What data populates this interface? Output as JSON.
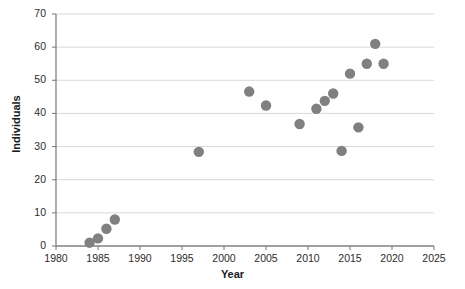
{
  "chart_data": {
    "type": "scatter",
    "title": "",
    "xlabel": "Year",
    "ylabel": "Individuals",
    "xlim": [
      1980,
      2025
    ],
    "ylim": [
      0,
      70
    ],
    "xticks": [
      1980,
      1985,
      1990,
      1995,
      2000,
      2005,
      2010,
      2015,
      2020,
      2025
    ],
    "yticks": [
      0,
      10,
      20,
      30,
      40,
      50,
      60,
      70
    ],
    "grid": "horizontal",
    "legend": null,
    "marker": {
      "shape": "circle",
      "color": "#808080",
      "size": 5.2
    },
    "series": [
      {
        "name": "Individuals",
        "points": [
          {
            "x": 1984,
            "y": 1.0
          },
          {
            "x": 1985,
            "y": 2.3
          },
          {
            "x": 1986,
            "y": 5.2
          },
          {
            "x": 1987,
            "y": 8.0
          },
          {
            "x": 1997,
            "y": 28.4
          },
          {
            "x": 2003,
            "y": 46.6
          },
          {
            "x": 2005,
            "y": 42.4
          },
          {
            "x": 2009,
            "y": 36.8
          },
          {
            "x": 2011,
            "y": 41.4
          },
          {
            "x": 2012,
            "y": 43.8
          },
          {
            "x": 2013,
            "y": 46.0
          },
          {
            "x": 2014,
            "y": 28.7
          },
          {
            "x": 2015,
            "y": 52.0
          },
          {
            "x": 2016,
            "y": 35.8
          },
          {
            "x": 2017,
            "y": 55.0
          },
          {
            "x": 2018,
            "y": 61.0
          },
          {
            "x": 2019,
            "y": 55.0
          }
        ]
      }
    ]
  },
  "style": {
    "axis_color": "#808080",
    "grid_color": "#d9d9d9",
    "text_color": "#1a1a1a",
    "background": "#ffffff"
  }
}
